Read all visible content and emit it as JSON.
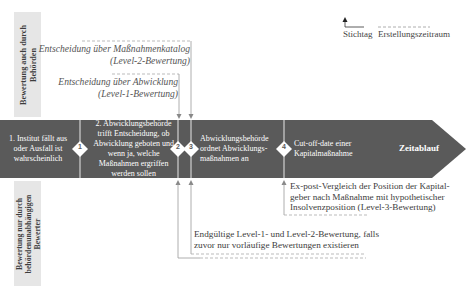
{
  "side_tabs": {
    "top": {
      "line1": "Bewertung auch durch",
      "line2": "Behörden"
    },
    "bottom": {
      "line1": "Bewertung nur durch",
      "line2": "behördenunabhängigen",
      "line3": "Bewerter"
    }
  },
  "legend": {
    "stichtag_label": "Stichtag",
    "erstellungszeitraum_label": "Erstellungszeitraum"
  },
  "upper_annotations": [
    {
      "line1": "Entscheidung über Maßnahmenkatalog",
      "line2": "(Level-2-Bewertung)"
    },
    {
      "line1": "Entscheidung über Abwicklung",
      "line2": "(Level-1-Bewertung)"
    }
  ],
  "timeline": {
    "label": "Zeitablauf",
    "colors": {
      "band": "#5a5a5a",
      "divider": "#e8e8e8",
      "tab": "#e6e6e6"
    },
    "steps": [
      {
        "lines": [
          "1. Institut fällt aus",
          "oder Ausfall ist",
          "wahrscheinlich"
        ]
      },
      {
        "lines": [
          "2. Abwicklungsbehörde",
          "trifft Entscheidung, ob",
          "Abwicklung geboten und",
          "wenn ja, welche",
          "Maßnahmen ergriffen",
          "werden sollen"
        ]
      },
      {
        "lines": [
          "Abwicklungsbehörde",
          "ordnet Abwicklungs-",
          "maßnahmen an"
        ]
      },
      {
        "lines": [
          "Cut-off-date einer",
          "Kapitalmaßnahme"
        ]
      }
    ],
    "markers": [
      "1",
      "2",
      "3",
      "4"
    ]
  },
  "lower_annotations": [
    {
      "lines": [
        "Ex-post-Vergleich der Position der Kapital-",
        "geber nach Maßnahme mit hypothetischer",
        "Insolvenzposition (Level-3-Bewertung)"
      ]
    },
    {
      "lines": [
        "Endgültige Level-1- und Level-2-Bewertung, falls",
        "zuvor nur vorläufige Bewertungen existieren"
      ]
    }
  ]
}
